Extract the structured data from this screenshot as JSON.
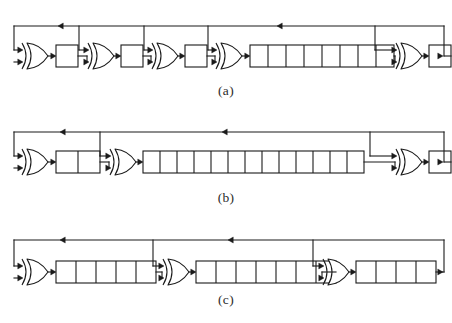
{
  "figure": {
    "background_color": "#ffffff",
    "line_color": "#1a1a1a",
    "fill_color": "#ffffff",
    "caption_color": "#2b2b2b",
    "stroke_width": 1.1
  },
  "captions": {
    "a": "(a)",
    "b": "(b)",
    "c": "(c)"
  },
  "diagrams": [
    {
      "id": "a",
      "label": "(a)",
      "baseline_y": 56,
      "feedback_y": 26,
      "start_x": 14,
      "end_x": 444,
      "gate_count": 5,
      "register_count": 5,
      "register_cell_counts": [
        1,
        1,
        1,
        8,
        1
      ],
      "total_stages": 12,
      "feedback_arrow_positions": [
        58,
        277
      ],
      "tap_positions": [
        79,
        144,
        208,
        375
      ],
      "elements": [
        {
          "type": "xor-gate",
          "index": 0,
          "x": 22,
          "inputs": 2
        },
        {
          "type": "register",
          "index": 0,
          "x": 56,
          "cells": 1,
          "cell_width": 22
        },
        {
          "type": "xor-gate",
          "index": 1,
          "x": 88,
          "inputs": 2
        },
        {
          "type": "register",
          "index": 1,
          "x": 121,
          "cells": 1,
          "cell_width": 22
        },
        {
          "type": "xor-gate",
          "index": 2,
          "x": 152,
          "inputs": 2
        },
        {
          "type": "register",
          "index": 2,
          "x": 185,
          "cells": 1,
          "cell_width": 22
        },
        {
          "type": "xor-gate",
          "index": 3,
          "x": 216,
          "inputs": 2
        },
        {
          "type": "register",
          "index": 3,
          "x": 250,
          "cells": 8,
          "cell_width": 18
        },
        {
          "type": "xor-gate",
          "index": 4,
          "x": 396,
          "inputs": 2
        },
        {
          "type": "register",
          "index": 4,
          "x": 429,
          "cells": 1,
          "cell_width": 22
        }
      ]
    },
    {
      "id": "b",
      "label": "(b)",
      "baseline_y": 162,
      "feedback_y": 132,
      "start_x": 14,
      "end_x": 444,
      "gate_count": 3,
      "register_count": 3,
      "register_cell_counts": [
        2,
        13,
        1
      ],
      "total_stages": 16,
      "feedback_arrow_positions": [
        60,
        222
      ],
      "tap_positions": [
        100,
        370
      ],
      "elements": [
        {
          "type": "xor-gate",
          "index": 0,
          "x": 22,
          "inputs": 2
        },
        {
          "type": "register",
          "index": 0,
          "x": 56,
          "cells": 2,
          "cell_width": 22
        },
        {
          "type": "xor-gate",
          "index": 1,
          "x": 110,
          "inputs": 2
        },
        {
          "type": "register",
          "index": 1,
          "x": 143,
          "cells": 13,
          "cell_width": 17
        },
        {
          "type": "xor-gate",
          "index": 2,
          "x": 396,
          "inputs": 2
        },
        {
          "type": "register",
          "index": 2,
          "x": 429,
          "cells": 1,
          "cell_width": 22
        }
      ]
    },
    {
      "id": "c",
      "label": "(c)",
      "baseline_y": 272,
      "feedback_y": 240,
      "start_x": 14,
      "end_x": 444,
      "gate_count": 3,
      "register_count": 3,
      "register_cell_counts": [
        5,
        7,
        4
      ],
      "total_stages": 16,
      "feedback_arrow_positions": [
        60,
        228
      ],
      "tap_positions": [
        153,
        313
      ],
      "elements": [
        {
          "type": "xor-gate",
          "index": 0,
          "x": 22,
          "inputs": 2
        },
        {
          "type": "register",
          "index": 0,
          "x": 56,
          "cells": 5,
          "cell_width": 20
        },
        {
          "type": "xor-gate",
          "index": 1,
          "x": 163,
          "inputs": 2
        },
        {
          "type": "register",
          "index": 1,
          "x": 196,
          "cells": 7,
          "cell_width": 20
        },
        {
          "type": "xor-gate",
          "index": 2,
          "x": 323,
          "inputs": 2
        },
        {
          "type": "register",
          "index": 2,
          "x": 356,
          "cells": 4,
          "cell_width": 20
        }
      ]
    }
  ]
}
